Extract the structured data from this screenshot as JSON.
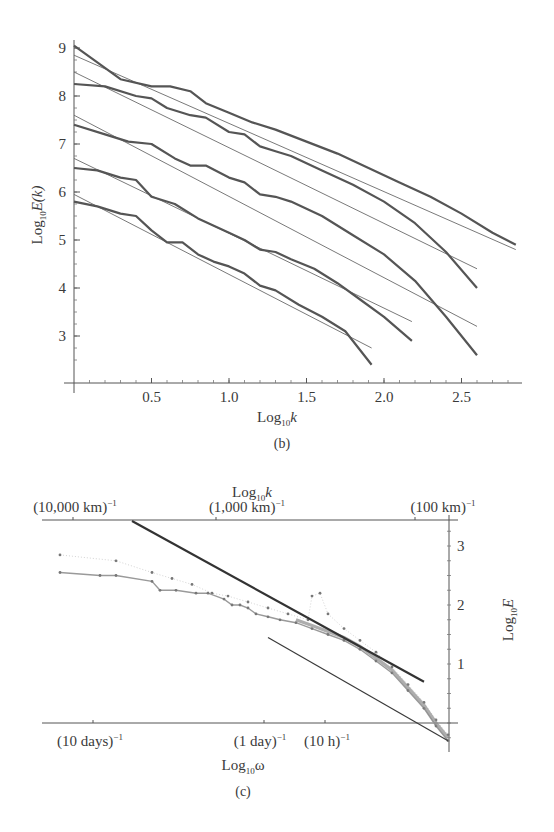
{
  "chart_data": [
    {
      "id": "b",
      "type": "line",
      "caption": "(b)",
      "xlabel": {
        "base": "Log",
        "sub": "10",
        "var": "k"
      },
      "ylabel": {
        "base": "Log",
        "sub": "10",
        "var": "E(k)"
      },
      "xlim": [
        0,
        2.9
      ],
      "ylim": [
        2.3,
        9.2
      ],
      "xticks": [
        {
          "value": 0.5,
          "label": "0.5"
        },
        {
          "value": 1.0,
          "label": "1.0"
        },
        {
          "value": 1.5,
          "label": "1.5"
        },
        {
          "value": 2.0,
          "label": "2.0"
        },
        {
          "value": 2.5,
          "label": "2.5"
        }
      ],
      "yticks": [
        {
          "value": 3,
          "label": "3"
        },
        {
          "value": 4,
          "label": "4"
        },
        {
          "value": 5,
          "label": "5"
        },
        {
          "value": 6,
          "label": "6"
        },
        {
          "value": 7,
          "label": "7"
        },
        {
          "value": 8,
          "label": "8"
        },
        {
          "value": 9,
          "label": "9"
        }
      ],
      "grid": false,
      "series": [
        {
          "name": "spectrum-1",
          "points": [
            [
              0,
              9.05
            ],
            [
              0.15,
              8.7
            ],
            [
              0.3,
              8.35
            ],
            [
              0.5,
              8.2
            ],
            [
              0.62,
              8.2
            ],
            [
              0.75,
              8.1
            ],
            [
              0.85,
              7.85
            ],
            [
              1.0,
              7.65
            ],
            [
              1.15,
              7.45
            ],
            [
              1.3,
              7.3
            ],
            [
              1.5,
              7.05
            ],
            [
              1.7,
              6.8
            ],
            [
              1.9,
              6.5
            ],
            [
              2.1,
              6.2
            ],
            [
              2.3,
              5.9
            ],
            [
              2.5,
              5.55
            ],
            [
              2.7,
              5.15
            ],
            [
              2.85,
              4.9
            ]
          ],
          "fit": [
            [
              0,
              8.85
            ],
            [
              2.85,
              4.8
            ]
          ]
        },
        {
          "name": "spectrum-2",
          "points": [
            [
              0,
              8.25
            ],
            [
              0.2,
              8.2
            ],
            [
              0.4,
              8.0
            ],
            [
              0.5,
              7.95
            ],
            [
              0.6,
              7.75
            ],
            [
              0.75,
              7.6
            ],
            [
              0.85,
              7.55
            ],
            [
              1.0,
              7.25
            ],
            [
              1.1,
              7.2
            ],
            [
              1.2,
              6.95
            ],
            [
              1.3,
              6.85
            ],
            [
              1.4,
              6.75
            ],
            [
              1.6,
              6.45
            ],
            [
              1.8,
              6.15
            ],
            [
              2.0,
              5.8
            ],
            [
              2.2,
              5.35
            ],
            [
              2.4,
              4.75
            ],
            [
              2.6,
              4.0
            ]
          ],
          "fit": [
            [
              0,
              8.5
            ],
            [
              2.6,
              4.4
            ]
          ]
        },
        {
          "name": "spectrum-3",
          "points": [
            [
              0,
              7.4
            ],
            [
              0.2,
              7.2
            ],
            [
              0.35,
              7.05
            ],
            [
              0.5,
              7.0
            ],
            [
              0.65,
              6.7
            ],
            [
              0.75,
              6.55
            ],
            [
              0.85,
              6.55
            ],
            [
              1.0,
              6.3
            ],
            [
              1.1,
              6.2
            ],
            [
              1.2,
              5.95
            ],
            [
              1.3,
              5.9
            ],
            [
              1.4,
              5.8
            ],
            [
              1.6,
              5.5
            ],
            [
              1.8,
              5.1
            ],
            [
              2.0,
              4.7
            ],
            [
              2.2,
              4.15
            ],
            [
              2.4,
              3.4
            ],
            [
              2.6,
              2.6
            ]
          ],
          "fit": [
            [
              0,
              7.6
            ],
            [
              2.6,
              3.2
            ]
          ]
        },
        {
          "name": "spectrum-4",
          "points": [
            [
              0,
              6.5
            ],
            [
              0.15,
              6.45
            ],
            [
              0.3,
              6.3
            ],
            [
              0.4,
              6.25
            ],
            [
              0.5,
              5.9
            ],
            [
              0.65,
              5.75
            ],
            [
              0.8,
              5.45
            ],
            [
              1.0,
              5.15
            ],
            [
              1.1,
              5.0
            ],
            [
              1.2,
              4.8
            ],
            [
              1.3,
              4.75
            ],
            [
              1.4,
              4.6
            ],
            [
              1.55,
              4.4
            ],
            [
              1.7,
              4.1
            ],
            [
              1.85,
              3.75
            ],
            [
              2.0,
              3.4
            ],
            [
              2.18,
              2.9
            ]
          ],
          "fit": [
            [
              0,
              6.7
            ],
            [
              2.18,
              3.3
            ]
          ]
        },
        {
          "name": "spectrum-5",
          "points": [
            [
              0,
              5.8
            ],
            [
              0.15,
              5.7
            ],
            [
              0.3,
              5.55
            ],
            [
              0.4,
              5.5
            ],
            [
              0.5,
              5.2
            ],
            [
              0.6,
              4.95
            ],
            [
              0.7,
              4.95
            ],
            [
              0.8,
              4.7
            ],
            [
              0.9,
              4.55
            ],
            [
              1.0,
              4.45
            ],
            [
              1.1,
              4.3
            ],
            [
              1.2,
              4.05
            ],
            [
              1.3,
              3.95
            ],
            [
              1.45,
              3.65
            ],
            [
              1.6,
              3.4
            ],
            [
              1.75,
              3.1
            ],
            [
              1.92,
              2.4
            ]
          ],
          "fit": [
            [
              0,
              5.95
            ],
            [
              1.92,
              2.75
            ]
          ]
        }
      ]
    },
    {
      "id": "c",
      "type": "scatter",
      "caption": "(c)",
      "top_axis_title": {
        "base": "Log",
        "sub": "10",
        "var": "k"
      },
      "top_ticks": [
        {
          "label": "(10,000 km)",
          "sup": "−1"
        },
        {
          "label": "(1,000 km)",
          "sup": "−1"
        },
        {
          "label": "(100 km)",
          "sup": "−1"
        }
      ],
      "bottom_axis_title": {
        "base": "Log",
        "sub": "10",
        "var": "ω"
      },
      "bottom_ticks": [
        {
          "label": "(10 days)",
          "sup": "−1"
        },
        {
          "label": "(1 day)",
          "sup": "−1"
        },
        {
          "label": "(10 h)",
          "sup": "−1"
        }
      ],
      "right_axis_title": {
        "base": "Log",
        "sub": "10",
        "var": "E"
      },
      "yticks": [
        {
          "value": 1,
          "label": "1"
        },
        {
          "value": 2,
          "label": "2"
        },
        {
          "value": 3,
          "label": "3"
        }
      ],
      "ylim": [
        -0.3,
        3.4
      ],
      "xlim": [
        0,
        1
      ],
      "grid": false,
      "reference_line": [
        [
          0.21,
          3.4
        ],
        [
          0.94,
          0.7
        ]
      ],
      "fit_line": [
        [
          0.55,
          1.45
        ],
        [
          1.0,
          -0.3
        ]
      ],
      "series": [
        {
          "name": "spectrum-upper",
          "points": [
            [
              0.03,
              2.85
            ],
            [
              0.17,
              2.75
            ],
            [
              0.26,
              2.55
            ],
            [
              0.31,
              2.45
            ],
            [
              0.36,
              2.35
            ],
            [
              0.41,
              2.2
            ],
            [
              0.45,
              2.15
            ],
            [
              0.5,
              2.05
            ],
            [
              0.55,
              1.95
            ],
            [
              0.6,
              1.85
            ],
            [
              0.65,
              1.75
            ],
            [
              0.66,
              2.15
            ],
            [
              0.68,
              2.2
            ],
            [
              0.7,
              1.85
            ],
            [
              0.74,
              1.6
            ],
            [
              0.78,
              1.4
            ],
            [
              0.82,
              1.2
            ],
            [
              0.86,
              0.95
            ],
            [
              0.9,
              0.65
            ],
            [
              0.94,
              0.35
            ],
            [
              0.97,
              0.05
            ],
            [
              1.0,
              -0.2
            ]
          ]
        },
        {
          "name": "spectrum-lower",
          "points": [
            [
              0.03,
              2.55
            ],
            [
              0.13,
              2.5
            ],
            [
              0.17,
              2.5
            ],
            [
              0.26,
              2.4
            ],
            [
              0.28,
              2.25
            ],
            [
              0.32,
              2.25
            ],
            [
              0.37,
              2.2
            ],
            [
              0.4,
              2.2
            ],
            [
              0.44,
              2.1
            ],
            [
              0.46,
              2.0
            ],
            [
              0.48,
              2.0
            ],
            [
              0.5,
              1.95
            ],
            [
              0.52,
              1.85
            ],
            [
              0.55,
              1.8
            ],
            [
              0.58,
              1.75
            ],
            [
              0.62,
              1.7
            ],
            [
              0.66,
              1.6
            ],
            [
              0.7,
              1.5
            ],
            [
              0.74,
              1.4
            ],
            [
              0.78,
              1.25
            ],
            [
              0.82,
              1.05
            ],
            [
              0.86,
              0.85
            ],
            [
              0.9,
              0.55
            ],
            [
              0.94,
              0.25
            ],
            [
              0.97,
              -0.05
            ],
            [
              1.0,
              -0.3
            ]
          ]
        }
      ]
    }
  ]
}
